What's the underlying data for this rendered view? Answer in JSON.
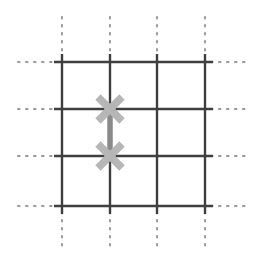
{
  "figure": {
    "title": "Square lattice with bond-connected defect pair",
    "background_color": "#ffffff",
    "width": 258,
    "height": 259
  },
  "chart_data": {
    "type": "scatter",
    "title": "Square lattice with bond-connected defect pair",
    "xlabel": "",
    "ylabel": "",
    "xlim": [
      0,
      258
    ],
    "ylim": [
      0,
      259
    ],
    "grid": true,
    "legend_position": "none",
    "lattice": {
      "vertical_lines_x": [
        62,
        110,
        157,
        205
      ],
      "horizontal_lines_y": [
        62,
        109,
        156,
        206
      ],
      "solid_color": "#3f3f3f",
      "solid_width": 2.4,
      "solid_extent": {
        "x_start": 54,
        "x_end": 213,
        "y_start": 54,
        "y_end": 214
      },
      "dotted_color": "#9a9a9a",
      "dotted_width": 2.0,
      "dotted_dash": "1.6 6.4",
      "dotted_extent": {
        "left_x": 18,
        "right_x": 245,
        "top_y": 17,
        "bottom_y": 246
      }
    },
    "markers": [
      {
        "name": "defect-x-upper",
        "shape": "diagonal-cross",
        "x": 110,
        "y": 109,
        "arm_half_length": 17,
        "stroke_width": 7.5,
        "color": "#b6b6b6"
      },
      {
        "name": "defect-x-lower",
        "shape": "diagonal-cross",
        "x": 110,
        "y": 156,
        "arm_half_length": 17,
        "stroke_width": 7.5,
        "color": "#b6b6b6"
      }
    ],
    "bond": {
      "name": "defect-bond",
      "x": 110,
      "y_start": 109,
      "y_end": 156,
      "stroke_width": 5.5,
      "color": "#8a8a8a"
    }
  }
}
